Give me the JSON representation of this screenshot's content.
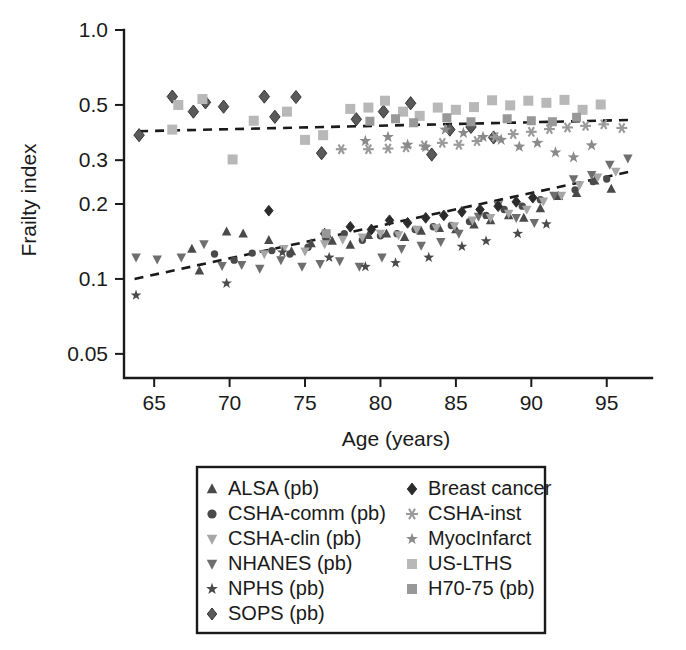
{
  "chart_data": {
    "type": "scatter",
    "title": "",
    "xlabel": "Age (years)",
    "ylabel": "Frailty index",
    "xlim": [
      63,
      98
    ],
    "ylim": [
      0.04,
      1.0
    ],
    "yscale": "log",
    "xscale": "linear",
    "grid": false,
    "legend_position": "bottom-center",
    "xticks": [
      65,
      70,
      75,
      80,
      85,
      90,
      95
    ],
    "xtick_labels": [
      "65",
      "70",
      "75",
      "80",
      "85",
      "90",
      "95"
    ],
    "yticks": [
      1.0,
      0.5,
      0.3,
      0.2,
      0.1,
      0.05
    ],
    "ytick_labels": [
      "1.0",
      "0.5",
      "0.3",
      "0.2",
      "0.1",
      "0.05"
    ],
    "series": [
      {
        "name": "ALSA (pb)",
        "marker": "triangle-up",
        "color": "#4a4a4a",
        "size": 9,
        "points": [
          [
            67.5,
            0.132
          ],
          [
            68.0,
            0.108
          ],
          [
            69.8,
            0.155
          ],
          [
            70.9,
            0.152
          ],
          [
            72.6,
            0.143
          ],
          [
            74.1,
            0.129
          ],
          [
            75.4,
            0.139
          ],
          [
            76.8,
            0.142
          ],
          [
            78.0,
            0.137
          ],
          [
            79.2,
            0.15
          ],
          [
            80.4,
            0.152
          ],
          [
            81.6,
            0.147
          ],
          [
            82.7,
            0.156
          ],
          [
            83.9,
            0.16
          ],
          [
            85.0,
            0.158
          ],
          [
            86.2,
            0.165
          ],
          [
            87.3,
            0.172
          ],
          [
            88.5,
            0.18
          ],
          [
            89.5,
            0.176
          ],
          [
            90.6,
            0.192
          ],
          [
            91.8,
            0.215
          ],
          [
            93.0,
            0.221
          ],
          [
            94.2,
            0.248
          ],
          [
            95.3,
            0.23
          ]
        ]
      },
      {
        "name": "CSHA-comm (pb)",
        "marker": "circle",
        "color": "#4a4a4a",
        "size": 8,
        "points": [
          [
            69.0,
            0.126
          ],
          [
            70.3,
            0.119
          ],
          [
            71.5,
            0.127
          ],
          [
            72.8,
            0.13
          ],
          [
            74.0,
            0.126
          ],
          [
            75.2,
            0.134
          ],
          [
            76.4,
            0.145
          ],
          [
            77.6,
            0.152
          ],
          [
            78.8,
            0.143
          ],
          [
            80.0,
            0.149
          ],
          [
            81.1,
            0.152
          ],
          [
            82.3,
            0.158
          ],
          [
            83.5,
            0.162
          ],
          [
            84.7,
            0.164
          ],
          [
            85.9,
            0.17
          ],
          [
            87.0,
            0.18
          ],
          [
            88.2,
            0.19
          ],
          [
            89.4,
            0.196
          ],
          [
            90.6,
            0.208
          ],
          [
            91.7,
            0.215
          ],
          [
            92.9,
            0.228
          ],
          [
            94.1,
            0.246
          ],
          [
            95.0,
            0.252
          ]
        ]
      },
      {
        "name": "CSHA-clin (pb)",
        "marker": "triangle-down",
        "color": "#a6a6a6",
        "size": 9,
        "points": [
          [
            72.3,
            0.126
          ],
          [
            73.6,
            0.132
          ],
          [
            75.0,
            0.129
          ],
          [
            76.3,
            0.138
          ],
          [
            77.5,
            0.144
          ],
          [
            78.8,
            0.147
          ],
          [
            80.0,
            0.152
          ],
          [
            81.2,
            0.15
          ],
          [
            82.4,
            0.158
          ],
          [
            83.7,
            0.16
          ],
          [
            84.9,
            0.163
          ],
          [
            86.1,
            0.172
          ],
          [
            87.3,
            0.176
          ],
          [
            88.5,
            0.183
          ],
          [
            89.7,
            0.19
          ],
          [
            90.8,
            0.205
          ],
          [
            92.0,
            0.216
          ],
          [
            93.2,
            0.238
          ],
          [
            94.4,
            0.256
          ],
          [
            95.6,
            0.27
          ]
        ]
      },
      {
        "name": "NHANES (pb)",
        "marker": "triangle-down",
        "color": "#6e6e6e",
        "size": 9,
        "points": [
          [
            63.8,
            0.122
          ],
          [
            65.2,
            0.12
          ],
          [
            66.8,
            0.122
          ],
          [
            68.3,
            0.138
          ],
          [
            69.5,
            0.113
          ],
          [
            70.8,
            0.114
          ],
          [
            72.0,
            0.11
          ],
          [
            73.4,
            0.119
          ],
          [
            74.8,
            0.112
          ],
          [
            76.0,
            0.115
          ],
          [
            77.3,
            0.118
          ],
          [
            78.6,
            0.112
          ],
          [
            80.1,
            0.122
          ],
          [
            81.4,
            0.132
          ],
          [
            82.7,
            0.136
          ],
          [
            84.0,
            0.141
          ],
          [
            85.2,
            0.152
          ],
          [
            86.5,
            0.178
          ],
          [
            87.8,
            0.198
          ],
          [
            89.0,
            0.176
          ],
          [
            90.2,
            0.168
          ],
          [
            91.5,
            0.216
          ],
          [
            92.8,
            0.252
          ],
          [
            94.0,
            0.262
          ],
          [
            95.2,
            0.288
          ],
          [
            96.4,
            0.305
          ]
        ]
      },
      {
        "name": "NPHS (pb)",
        "marker": "star",
        "color": "#4a4a4a",
        "size": 9,
        "points": [
          [
            63.8,
            0.086
          ],
          [
            69.8,
            0.096
          ],
          [
            73.5,
            0.128
          ],
          [
            76.6,
            0.122
          ],
          [
            79.0,
            0.112
          ],
          [
            81.0,
            0.116
          ],
          [
            83.2,
            0.122
          ],
          [
            85.4,
            0.135
          ],
          [
            87.0,
            0.142
          ],
          [
            89.1,
            0.152
          ],
          [
            91.0,
            0.166
          ]
        ]
      },
      {
        "name": "SOPS (pb)",
        "marker": "diamond",
        "color": "#5a5a5a",
        "size": 11,
        "points": [
          [
            64.0,
            0.378
          ],
          [
            66.2,
            0.54
          ],
          [
            67.6,
            0.47
          ],
          [
            68.4,
            0.512
          ],
          [
            69.6,
            0.492
          ],
          [
            72.3,
            0.54
          ],
          [
            73.0,
            0.448
          ],
          [
            74.4,
            0.538
          ],
          [
            76.1,
            0.32
          ],
          [
            78.4,
            0.438
          ],
          [
            80.2,
            0.47
          ],
          [
            82.0,
            0.508
          ],
          [
            83.4,
            0.316
          ],
          [
            84.6,
            0.398
          ],
          [
            86.0,
            0.408
          ],
          [
            87.5,
            0.37
          ]
        ]
      },
      {
        "name": "Breast cancer",
        "marker": "diamond",
        "color": "#2b2b2b",
        "size": 9,
        "points": [
          [
            72.6,
            0.188
          ],
          [
            76.3,
            0.152
          ],
          [
            78.0,
            0.162
          ],
          [
            79.4,
            0.158
          ],
          [
            80.6,
            0.172
          ],
          [
            81.8,
            0.168
          ],
          [
            83.0,
            0.176
          ],
          [
            84.2,
            0.18
          ],
          [
            85.4,
            0.186
          ],
          [
            86.6,
            0.19
          ],
          [
            87.8,
            0.196
          ],
          [
            89.0,
            0.204
          ],
          [
            90.1,
            0.212
          ]
        ]
      },
      {
        "name": "CSHA-inst",
        "marker": "asterisk",
        "color": "#9a9a9a",
        "size": 9,
        "points": [
          [
            77.4,
            0.332
          ],
          [
            79.2,
            0.332
          ],
          [
            80.5,
            0.334
          ],
          [
            81.7,
            0.338
          ],
          [
            82.9,
            0.344
          ],
          [
            84.1,
            0.352
          ],
          [
            85.2,
            0.346
          ],
          [
            86.4,
            0.358
          ],
          [
            87.6,
            0.372
          ],
          [
            88.8,
            0.382
          ],
          [
            90.0,
            0.39
          ],
          [
            91.2,
            0.4
          ],
          [
            92.4,
            0.406
          ],
          [
            93.6,
            0.412
          ],
          [
            94.8,
            0.418
          ],
          [
            96.0,
            0.404
          ]
        ]
      },
      {
        "name": "MyocInfarct",
        "marker": "star",
        "color": "#8a8a8a",
        "size": 10,
        "points": [
          [
            79.0,
            0.358
          ],
          [
            80.5,
            0.372
          ],
          [
            81.8,
            0.346
          ],
          [
            83.0,
            0.338
          ],
          [
            84.3,
            0.398
          ],
          [
            85.5,
            0.386
          ],
          [
            86.8,
            0.372
          ],
          [
            88.0,
            0.362
          ],
          [
            89.2,
            0.34
          ],
          [
            90.4,
            0.352
          ],
          [
            91.6,
            0.322
          ],
          [
            92.8,
            0.308
          ],
          [
            94.0,
            0.344
          ]
        ]
      },
      {
        "name": "US-LTHS",
        "marker": "square",
        "color": "#b8b8b8",
        "size": 10,
        "points": [
          [
            66.2,
            0.398
          ],
          [
            66.6,
            0.5
          ],
          [
            68.2,
            0.528
          ],
          [
            70.2,
            0.302
          ],
          [
            71.6,
            0.432
          ],
          [
            73.8,
            0.47
          ],
          [
            75.0,
            0.362
          ],
          [
            76.2,
            0.378
          ],
          [
            78.0,
            0.482
          ],
          [
            79.2,
            0.488
          ],
          [
            80.3,
            0.52
          ],
          [
            81.5,
            0.47
          ],
          [
            82.6,
            0.452
          ],
          [
            83.8,
            0.488
          ],
          [
            85.0,
            0.478
          ],
          [
            86.2,
            0.49
          ],
          [
            87.4,
            0.522
          ],
          [
            88.6,
            0.498
          ],
          [
            89.8,
            0.52
          ],
          [
            91.0,
            0.51
          ],
          [
            92.2,
            0.524
          ],
          [
            93.4,
            0.478
          ],
          [
            94.6,
            0.502
          ]
        ]
      },
      {
        "name": "H70-75 (pb)",
        "marker": "square",
        "color": "#989898",
        "size": 9,
        "points": [
          [
            76.4,
            0.152
          ],
          [
            79.3,
            0.43
          ],
          [
            81.0,
            0.44
          ],
          [
            82.2,
            0.424
          ],
          [
            84.4,
            0.444
          ],
          [
            86.0,
            0.428
          ],
          [
            88.4,
            0.44
          ],
          [
            90.0,
            0.432
          ],
          [
            91.4,
            0.428
          ],
          [
            93.0,
            0.446
          ]
        ]
      }
    ],
    "trend_lines": [
      {
        "name": "upper-trend",
        "style": "dashed",
        "color": "#1a1a1a",
        "x": [
          64.0,
          96.5
        ],
        "y": [
          0.392,
          0.435
        ]
      },
      {
        "name": "lower-trend",
        "style": "dashed",
        "color": "#1a1a1a",
        "x": [
          63.7,
          96.8
        ],
        "y": [
          0.1,
          0.272
        ]
      }
    ]
  },
  "legend": {
    "column_left": [
      {
        "label": "ALSA (pb)",
        "marker": "triangle-up",
        "color": "#4a4a4a"
      },
      {
        "label": "CSHA-comm (pb)",
        "marker": "circle",
        "color": "#4a4a4a"
      },
      {
        "label": "CSHA-clin (pb)",
        "marker": "triangle-down",
        "color": "#a6a6a6"
      },
      {
        "label": "NHANES (pb)",
        "marker": "triangle-down",
        "color": "#6e6e6e"
      },
      {
        "label": "NPHS (pb)",
        "marker": "star",
        "color": "#4a4a4a"
      },
      {
        "label": "SOPS (pb)",
        "marker": "diamond",
        "color": "#5a5a5a"
      }
    ],
    "column_right": [
      {
        "label": "Breast cancer",
        "marker": "diamond",
        "color": "#2b2b2b"
      },
      {
        "label": "CSHA-inst",
        "marker": "asterisk",
        "color": "#9a9a9a"
      },
      {
        "label": "MyocInfarct",
        "marker": "star",
        "color": "#8a8a8a"
      },
      {
        "label": "US-LTHS",
        "marker": "square",
        "color": "#b8b8b8"
      },
      {
        "label": "H70-75 (pb)",
        "marker": "square",
        "color": "#989898"
      }
    ]
  }
}
